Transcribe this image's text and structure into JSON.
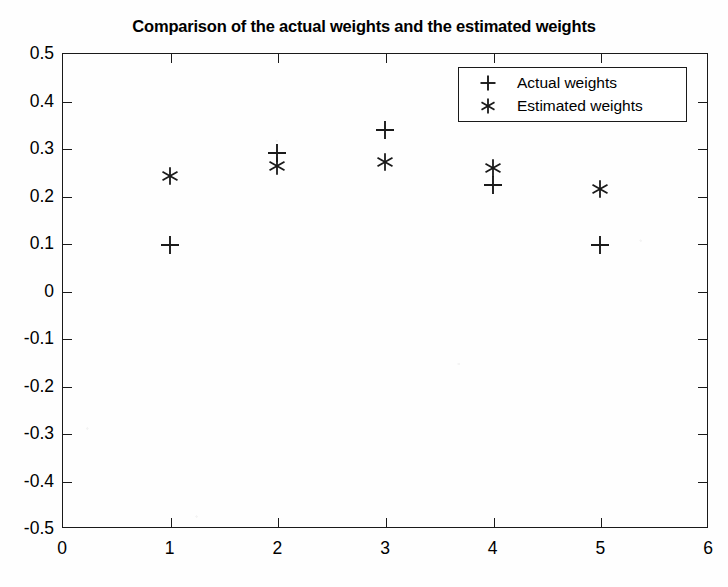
{
  "chart_data": {
    "type": "scatter",
    "title": "Comparison of the actual weights and the estimated weights",
    "xlabel": "",
    "ylabel": "",
    "xlim": [
      0,
      6
    ],
    "ylim": [
      -0.5,
      0.5
    ],
    "xticks": [
      0,
      1,
      2,
      3,
      4,
      5,
      6
    ],
    "xtick_labels": [
      "0",
      "1",
      "2",
      "3",
      "4",
      "5",
      "6"
    ],
    "yticks": [
      -0.5,
      -0.4,
      -0.3,
      -0.2,
      -0.1,
      0,
      0.1,
      0.2,
      0.3,
      0.4,
      0.5
    ],
    "ytick_labels": [
      "0.5",
      "0.4",
      "0.3",
      "0.2",
      "0.1",
      "0",
      "-0.1",
      "-0.2",
      "-0.3",
      "-0.4",
      "-0.5"
    ],
    "grid": false,
    "legend_position": "upper right",
    "x": [
      1,
      2,
      3,
      4,
      5
    ],
    "series": [
      {
        "name": "Actual weights",
        "marker": "+",
        "color": "#1a1a1a",
        "values": [
          0.096,
          0.289,
          0.337,
          0.223,
          0.096
        ]
      },
      {
        "name": "Estimated weights",
        "marker": "*",
        "color": "#1a1a1a",
        "values": [
          0.242,
          0.262,
          0.271,
          0.258,
          0.214
        ]
      }
    ]
  },
  "legend": {
    "entries": [
      {
        "label": "Actual weights",
        "marker": "plus-marker-icon"
      },
      {
        "label": "Estimated weights",
        "marker": "asterisk-marker-icon"
      }
    ]
  },
  "axes": {
    "frame_color": "#1a1a1a"
  }
}
